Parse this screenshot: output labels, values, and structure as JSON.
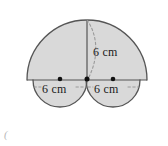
{
  "figure": {
    "fill_color": "#d9d9d9",
    "stroke_color": "#555555",
    "dash_color": "#8f8f8f",
    "dot_color": "#111111",
    "text_color": "#1a1a1a",
    "background_color": "#ffffff"
  },
  "labels": {
    "vertical_radius": "6 cm",
    "left_diameter": "6 cm",
    "right_diameter": "6 cm"
  },
  "corner": {
    "mark": "("
  },
  "geometry": {
    "big_semicircle": {
      "center_x": 87,
      "center_y": 80,
      "radius": 60,
      "orientation": "upper"
    },
    "small_semicircle_left": {
      "center_x": 60,
      "center_y": 80,
      "radius": 27,
      "orientation": "lower"
    },
    "small_semicircle_right": {
      "center_x": 113,
      "center_y": 80,
      "radius": 27,
      "orientation": "lower"
    },
    "baseline": {
      "x1": 27,
      "x2": 147,
      "y": 80
    },
    "vertical_radius_line": {
      "x": 87,
      "y1": 20,
      "y2": 80
    },
    "dots": [
      {
        "name": "left-center-dot",
        "x": 60,
        "y": 79
      },
      {
        "name": "origin-dot",
        "x": 87,
        "y": 79
      },
      {
        "name": "right-center-dot",
        "x": 113,
        "y": 79
      }
    ]
  }
}
